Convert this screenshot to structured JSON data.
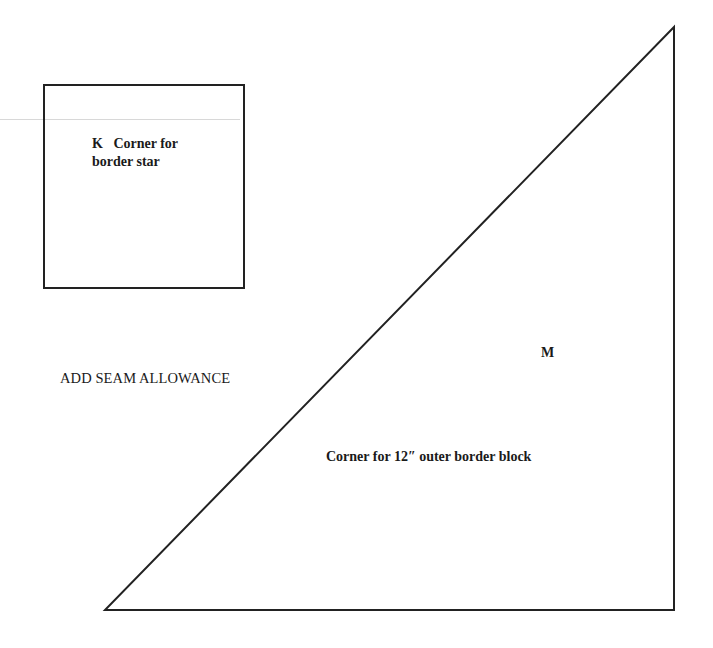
{
  "pattern_pieces": [
    {
      "id": "K",
      "label_line1": "K   Corner for",
      "label_line2": "border star",
      "shape": "square"
    },
    {
      "id": "M",
      "letter": "M",
      "description": "Corner for 12″ outer border block",
      "shape": "right-triangle"
    }
  ],
  "instructions": {
    "seam_allowance": "ADD SEAM ALLOWANCE"
  },
  "colors": {
    "line": "#222222",
    "background": "#ffffff"
  }
}
